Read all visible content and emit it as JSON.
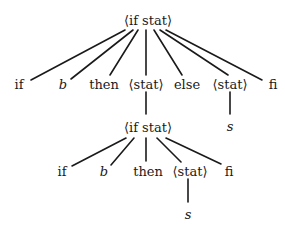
{
  "diagram": {
    "type": "parse-tree",
    "colors": {
      "line": "#1a1a1a",
      "text": "#1a1a1a",
      "background": "#ffffff"
    },
    "nodes": {
      "root": {
        "label": "⟨if stat⟩",
        "x": 148,
        "y": 20
      },
      "l1_if": {
        "label": "if",
        "x": 19,
        "y": 84
      },
      "l1_b": {
        "label": "b",
        "x": 63,
        "y": 84,
        "italic": true
      },
      "l1_then": {
        "label": "then",
        "x": 104,
        "y": 84
      },
      "l1_stat1": {
        "label": "⟨stat⟩",
        "x": 146,
        "y": 84
      },
      "l1_else": {
        "label": "else",
        "x": 187,
        "y": 84
      },
      "l1_stat2": {
        "label": "⟨stat⟩",
        "x": 230,
        "y": 84
      },
      "l1_fi": {
        "label": "fi",
        "x": 273,
        "y": 84
      },
      "l2_ifstat": {
        "label": "⟨if stat⟩",
        "x": 148,
        "y": 127
      },
      "l2_s": {
        "label": "s",
        "x": 230,
        "y": 126,
        "italic": true
      },
      "l3_if": {
        "label": "if",
        "x": 62,
        "y": 171
      },
      "l3_b": {
        "label": "b",
        "x": 104,
        "y": 171,
        "italic": true
      },
      "l3_then": {
        "label": "then",
        "x": 148,
        "y": 171
      },
      "l3_stat": {
        "label": "⟨stat⟩",
        "x": 190,
        "y": 171
      },
      "l3_fi": {
        "label": "fi",
        "x": 229,
        "y": 171
      },
      "l4_s": {
        "label": "s",
        "x": 188,
        "y": 214,
        "italic": true
      }
    },
    "edges": [
      {
        "from": "root",
        "to": "l1_if",
        "x1": 125,
        "y1": 30,
        "x2": 31,
        "y2": 80
      },
      {
        "from": "root",
        "to": "l1_b",
        "x1": 133,
        "y1": 30,
        "x2": 71,
        "y2": 79
      },
      {
        "from": "root",
        "to": "l1_then",
        "x1": 138,
        "y1": 30,
        "x2": 110,
        "y2": 75
      },
      {
        "from": "root",
        "to": "l1_stat1",
        "x1": 146,
        "y1": 30,
        "x2": 146,
        "y2": 75
      },
      {
        "from": "root",
        "to": "l1_else",
        "x1": 154,
        "y1": 30,
        "x2": 182,
        "y2": 75
      },
      {
        "from": "root",
        "to": "l1_stat2",
        "x1": 160,
        "y1": 30,
        "x2": 228,
        "y2": 75
      },
      {
        "from": "root",
        "to": "l1_fi",
        "x1": 166,
        "y1": 30,
        "x2": 262,
        "y2": 80
      },
      {
        "from": "l1_stat1",
        "to": "l2_ifstat",
        "x1": 146,
        "y1": 92,
        "x2": 146,
        "y2": 114
      },
      {
        "from": "l1_stat2",
        "to": "l2_s",
        "x1": 230,
        "y1": 92,
        "x2": 230,
        "y2": 114
      },
      {
        "from": "l2_ifstat",
        "to": "l3_if",
        "x1": 126,
        "y1": 138,
        "x2": 72,
        "y2": 166
      },
      {
        "from": "l2_ifstat",
        "to": "l3_b",
        "x1": 134,
        "y1": 138,
        "x2": 111,
        "y2": 165
      },
      {
        "from": "l2_ifstat",
        "to": "l3_then",
        "x1": 146,
        "y1": 138,
        "x2": 146,
        "y2": 161
      },
      {
        "from": "l2_ifstat",
        "to": "l3_stat",
        "x1": 157,
        "y1": 138,
        "x2": 181,
        "y2": 162
      },
      {
        "from": "l2_ifstat",
        "to": "l3_fi",
        "x1": 166,
        "y1": 138,
        "x2": 221,
        "y2": 164
      },
      {
        "from": "l3_stat",
        "to": "l4_s",
        "x1": 188,
        "y1": 179,
        "x2": 188,
        "y2": 202
      }
    ]
  }
}
